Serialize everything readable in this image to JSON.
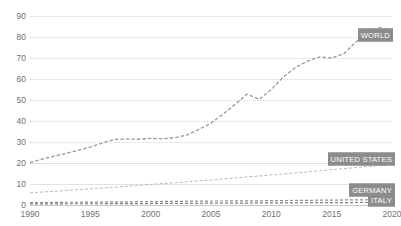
{
  "colors": {
    "world_line": "#9a9a9a",
    "us_line": "#b9b9b9",
    "germany_line": "#8e8e8e",
    "italy_line": "#7e7e7e",
    "grid": "#d8d8d8",
    "axis": "#c8c8c8",
    "tick_text": "#6f6f6f",
    "tag_bg": "#8c8c8c",
    "tag_text": "#ffffff"
  },
  "axes": {
    "y_ticks": [
      "0",
      "10",
      "20",
      "30",
      "40",
      "50",
      "60",
      "70",
      "80",
      "90"
    ],
    "x_ticks": [
      "1990",
      "1995",
      "2000",
      "2005",
      "2010",
      "2015",
      "2020"
    ]
  },
  "labels": {
    "world": "WORLD",
    "united_states": "UNITED STATES",
    "germany": "GERMANY",
    "italy": "ITALY"
  },
  "chart_data": {
    "type": "line",
    "title": "",
    "subtitle": "",
    "xlabel": "",
    "ylabel": "",
    "xlim": [
      1990,
      2020
    ],
    "ylim": [
      0,
      90
    ],
    "grid": true,
    "grid_style": "dotted-horizontal",
    "legend": "inline-end-labels",
    "x": [
      1990,
      1991,
      1992,
      1993,
      1994,
      1995,
      1996,
      1997,
      1998,
      1999,
      2000,
      2001,
      2002,
      2003,
      2004,
      2005,
      2006,
      2007,
      2008,
      2009,
      2010,
      2011,
      2012,
      2013,
      2014,
      2015,
      2016,
      2017,
      2018,
      2019,
      2020
    ],
    "series": [
      {
        "name": "WORLD",
        "values": [
          20.2,
          21.8,
          23.3,
          24.6,
          26.1,
          27.6,
          29.5,
          31.2,
          31.4,
          31.3,
          31.7,
          31.5,
          32.0,
          33.3,
          36.0,
          39.0,
          43.3,
          48.0,
          52.8,
          50.3,
          55.0,
          61.0,
          65.5,
          68.5,
          70.5,
          70.0,
          72.0,
          77.5,
          82.5,
          84.5,
          83.0
        ]
      },
      {
        "name": "UNITED STATES",
        "values": [
          5.8,
          6.2,
          6.5,
          6.9,
          7.3,
          7.7,
          8.1,
          8.5,
          8.9,
          9.3,
          9.8,
          10.2,
          10.6,
          11.0,
          11.5,
          11.9,
          12.4,
          12.9,
          13.4,
          13.8,
          14.3,
          14.8,
          15.3,
          15.8,
          16.3,
          16.8,
          17.3,
          17.8,
          18.3,
          18.8,
          19.3
        ]
      },
      {
        "name": "GERMANY",
        "values": [
          1.1,
          1.2,
          1.2,
          1.3,
          1.3,
          1.4,
          1.4,
          1.5,
          1.5,
          1.6,
          1.6,
          1.7,
          1.7,
          1.8,
          1.8,
          1.9,
          1.9,
          2.0,
          2.0,
          2.0,
          2.1,
          2.1,
          2.2,
          2.2,
          2.3,
          2.3,
          2.4,
          2.4,
          2.5,
          2.5,
          2.6
        ]
      },
      {
        "name": "ITALY",
        "values": [
          0.5,
          0.5,
          0.5,
          0.6,
          0.6,
          0.6,
          0.6,
          0.7,
          0.7,
          0.7,
          0.7,
          0.8,
          0.8,
          0.8,
          0.8,
          0.9,
          0.9,
          0.9,
          0.9,
          1.0,
          1.0,
          1.0,
          1.0,
          1.1,
          1.1,
          1.1,
          1.1,
          1.2,
          1.2,
          1.2,
          1.3
        ]
      }
    ]
  }
}
